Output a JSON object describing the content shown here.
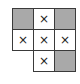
{
  "grid": {
    "origin": {
      "x": 12,
      "y": 8
    },
    "cell_size": 22,
    "colors": {
      "shaded": "#a9a9a9",
      "blank": "#ffffff",
      "border": "#3a3a3a",
      "mark": "#222222"
    },
    "cells": [
      {
        "row": 0,
        "col": 0,
        "state": "shaded",
        "mark": ""
      },
      {
        "row": 0,
        "col": 1,
        "state": "marked",
        "mark": "×"
      },
      {
        "row": 0,
        "col": 2,
        "state": "shaded",
        "mark": ""
      },
      {
        "row": 1,
        "col": 0,
        "state": "marked",
        "mark": "×"
      },
      {
        "row": 1,
        "col": 1,
        "state": "marked",
        "mark": "×"
      },
      {
        "row": 1,
        "col": 2,
        "state": "marked",
        "mark": "×"
      },
      {
        "row": 2,
        "col": 1,
        "state": "marked",
        "mark": "×"
      },
      {
        "row": 2,
        "col": 2,
        "state": "shaded",
        "mark": ""
      }
    ]
  }
}
